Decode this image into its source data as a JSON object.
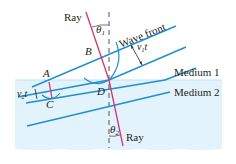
{
  "diagram": {
    "colors": {
      "medium2_fill": "#e3f3fb",
      "wavefront": "#1f8fd0",
      "ray": "#d6336c",
      "normal": "#444444",
      "text": "#231f20"
    },
    "labels": {
      "ray_top": "Ray",
      "ray_bottom": "Ray",
      "wave_front": "Wave front",
      "medium1": "Medium 1",
      "medium2": "Medium 2",
      "theta1": "θ",
      "theta1_sub": "1",
      "theta2": "θ",
      "theta2_sub": "2",
      "v1t": "v",
      "v1t_sub": "1",
      "v1t_t": "t",
      "v2t": "v",
      "v2t_sub": "2",
      "v2t_t": "t",
      "point_a": "A",
      "point_b": "B",
      "point_c": "C",
      "point_d": "D"
    }
  }
}
